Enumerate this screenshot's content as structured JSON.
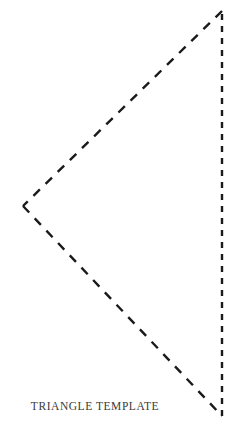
{
  "page": {
    "background_color": "#ffffff",
    "width": 245,
    "height": 432,
    "caption": "TRIANGLE TEMPLATE"
  },
  "shape": {
    "name": "triangle-template",
    "stroke_color": "#1a1a1a",
    "fill": "none",
    "stroke_width": 2.4,
    "line_style": "dashed",
    "vertices": [
      {
        "label": "apex-top-right",
        "x": 222,
        "y": 11
      },
      {
        "label": "left",
        "x": 23,
        "y": 206
      },
      {
        "label": "bottom-right",
        "x": 222,
        "y": 416
      }
    ],
    "edges": [
      {
        "name": "upper-diagonal",
        "from": "apex-top-right",
        "to": "left",
        "dash_length": 9,
        "gap_length": 8
      },
      {
        "name": "lower-diagonal",
        "from": "left",
        "to": "bottom-right",
        "dash_length": 9,
        "gap_length": 8
      },
      {
        "name": "right-vertical",
        "from": "bottom-right",
        "to": "apex-top-right",
        "dash_length": 6,
        "gap_length": 6
      }
    ]
  },
  "caption_label": {
    "text": "TRIANGLE TEMPLATE",
    "color": "#3a3a3a"
  }
}
